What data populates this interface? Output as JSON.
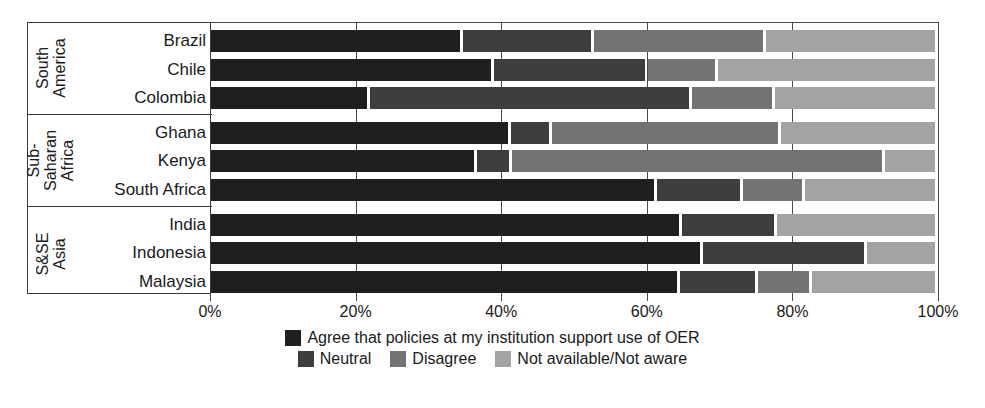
{
  "chart_data": {
    "type": "bar",
    "orientation": "horizontal",
    "stacked": true,
    "normalized": true,
    "title": "",
    "xlabel": "",
    "ylabel": "",
    "xlim": [
      0,
      100
    ],
    "grid": true,
    "legend_position": "bottom",
    "xtick_labels": [
      "0%",
      "20%",
      "40%",
      "60%",
      "80%",
      "100%"
    ],
    "xtick_values": [
      0,
      20,
      40,
      60,
      80,
      100
    ],
    "series": [
      {
        "name": "Agree that policies at my institution support use of OER",
        "color": "#1f1f1f"
      },
      {
        "name": "Neutral",
        "color": "#3d3d3d"
      },
      {
        "name": "Disagree",
        "color": "#737373"
      },
      {
        "name": "Not available/Not aware",
        "color": "#a3a3a3"
      }
    ],
    "groups": [
      {
        "label": "South America",
        "label_lines": [
          "South",
          "America"
        ],
        "categories": [
          {
            "name": "Brazil",
            "values": [
              34.8,
              17.9,
              23.7,
              23.6
            ]
          },
          {
            "name": "Chile",
            "values": [
              39.0,
              21.2,
              9.6,
              30.2
            ]
          },
          {
            "name": "Colombia",
            "values": [
              22.0,
              44.2,
              11.4,
              22.4
            ]
          }
        ]
      },
      {
        "label": "Sub-Saharan Africa",
        "label_lines": [
          "Sub-",
          "Saharan",
          "Africa"
        ],
        "categories": [
          {
            "name": "Ghana",
            "values": [
              41.3,
              5.7,
              31.4,
              21.6
            ]
          },
          {
            "name": "Kenya",
            "values": [
              36.7,
              4.8,
              51.2,
              7.3
            ]
          },
          {
            "name": "South Africa",
            "values": [
              61.4,
              11.8,
              8.5,
              18.3
            ]
          }
        ]
      },
      {
        "label": "S&SE Asia",
        "label_lines": [
          "S&SE",
          "Asia"
        ],
        "categories": [
          {
            "name": "India",
            "values": [
              64.8,
              13.1,
              0.0,
              22.1
            ]
          },
          {
            "name": "Indonesia",
            "values": [
              67.7,
              22.5,
              0.0,
              9.8
            ]
          },
          {
            "name": "Malaysia",
            "values": [
              64.6,
              10.7,
              7.4,
              17.3
            ]
          }
        ]
      }
    ]
  },
  "legend": {
    "row1": [
      {
        "label": "Agree that policies at my institution support use of OER",
        "color": "#1f1f1f"
      }
    ],
    "row2": [
      {
        "label": "Neutral",
        "color": "#3d3d3d"
      },
      {
        "label": "Disagree",
        "color": "#737373"
      },
      {
        "label": "Not available/Not aware",
        "color": "#a3a3a3"
      }
    ]
  },
  "axis": {
    "ticks": [
      {
        "label": "0%",
        "value": 0
      },
      {
        "label": "20%",
        "value": 20
      },
      {
        "label": "40%",
        "value": 40
      },
      {
        "label": "60%",
        "value": 60
      },
      {
        "label": "80%",
        "value": 80
      },
      {
        "label": "100%",
        "value": 100
      }
    ]
  }
}
